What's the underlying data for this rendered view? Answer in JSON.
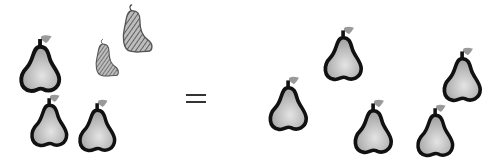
{
  "diagram": {
    "type": "picture-equation",
    "left_group": {
      "solid_pears": 4,
      "sketched_pears": 2,
      "description": "4 solid gray pears plus 2 pencil-sketched pears"
    },
    "operator": "=",
    "right_group": {
      "solid_pears": 5,
      "description": "5 solid gray pears"
    },
    "colors": {
      "pear_fill": "#b5b5b5",
      "pear_highlight": "#e0e0e0",
      "pear_outline": "#111111",
      "leaf": "#9a9a9a",
      "sketch_fill": "#8a8a8a"
    }
  }
}
